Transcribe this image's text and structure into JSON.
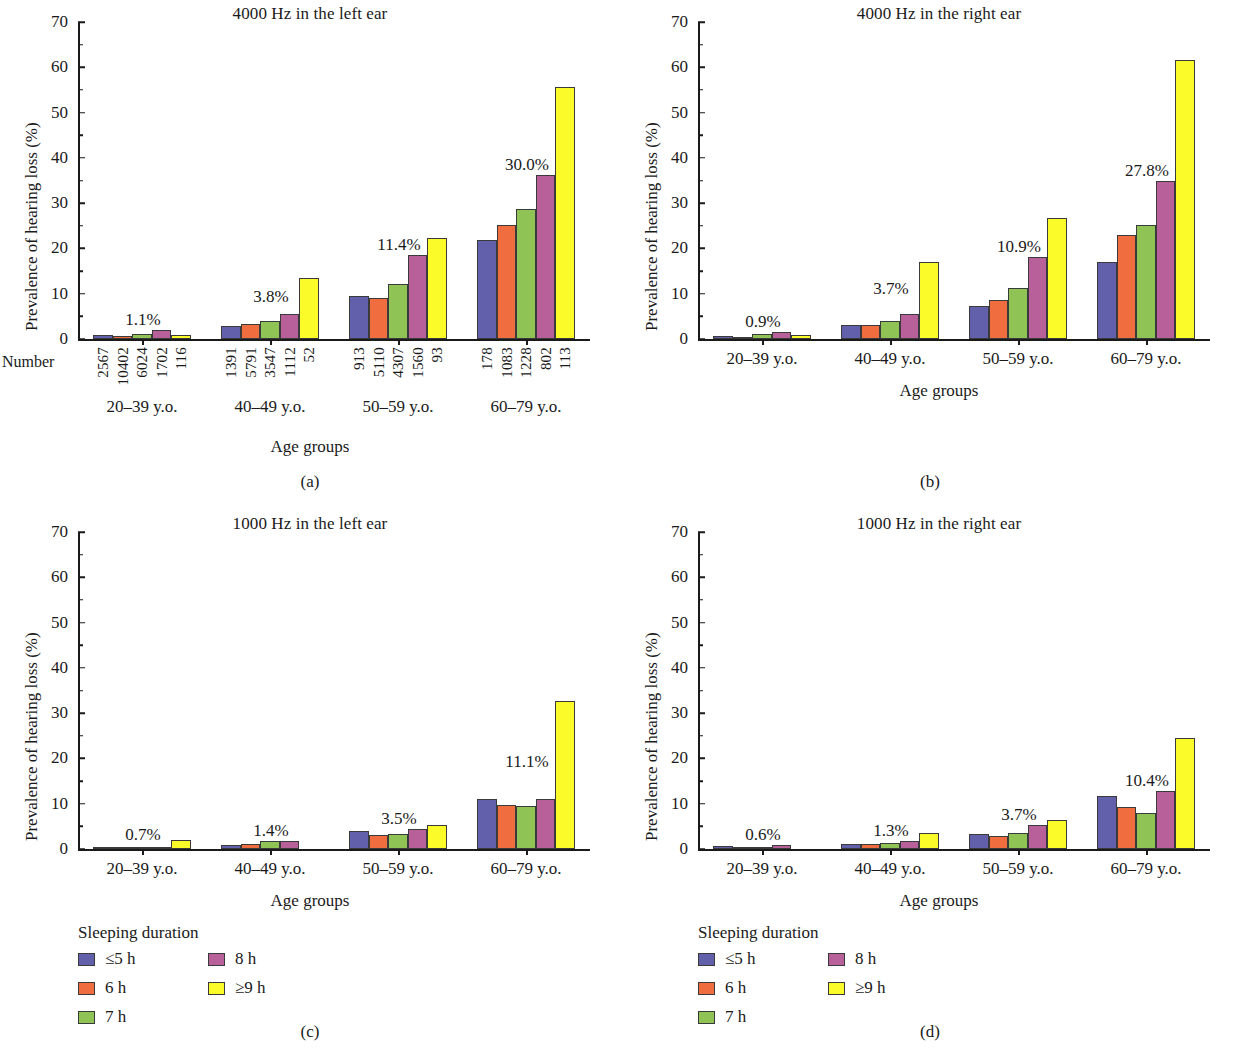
{
  "figure": {
    "axis": {
      "y_label": "Prevalence of hearing loss (%)",
      "x_label": "Age groups",
      "y_ticks": [
        "0",
        "10",
        "20",
        "30",
        "40",
        "50",
        "60",
        "70"
      ],
      "ylim": [
        0,
        70
      ]
    },
    "categories": [
      "20–39 y.o.",
      "40–49 y.o.",
      "50–59 y.o.",
      "60–79 y.o."
    ],
    "number_row_label": "Number",
    "legend": {
      "title": "Sleeping duration",
      "items": [
        {
          "label": "≤5 h",
          "color": "#6260ab"
        },
        {
          "label": "6 h",
          "color": "#ef6d3f"
        },
        {
          "label": "7 h",
          "color": "#8fc355"
        },
        {
          "label": "8 h",
          "color": "#b8609a"
        },
        {
          "label": "≥9 h",
          "color": "#fbfb2a"
        }
      ]
    },
    "series_colors": [
      "#6260ab",
      "#ef6d3f",
      "#8fc355",
      "#b8609a",
      "#fbfb2a"
    ],
    "panel_letters": [
      "(a)",
      "(b)",
      "(c)",
      "(d)"
    ]
  },
  "chart_data": [
    {
      "id": "a",
      "type": "bar",
      "title": "4000 Hz in the left ear",
      "panel_letter": "(a)",
      "xlabel": "Age groups",
      "ylabel": "Prevalence of hearing loss (%)",
      "ylim": [
        0,
        70
      ],
      "grid": false,
      "legend_position": "below-left",
      "categories": [
        "20–39 y.o.",
        "40–49 y.o.",
        "50–59 y.o.",
        "60–79 y.o."
      ],
      "series": [
        {
          "name": "≤5 h",
          "values": [
            0.8,
            2.8,
            9.4,
            21.8
          ]
        },
        {
          "name": "6 h",
          "values": [
            0.7,
            3.3,
            9.0,
            25.2
          ]
        },
        {
          "name": "7 h",
          "values": [
            1.2,
            3.9,
            12.1,
            28.7
          ]
        },
        {
          "name": "8 h",
          "values": [
            1.9,
            5.6,
            18.5,
            36.2
          ]
        },
        {
          "name": "≥9 h",
          "values": [
            0.8,
            13.5,
            22.3,
            55.6
          ]
        }
      ],
      "annotations": [
        "1.1%",
        "3.8%",
        "11.4%",
        "30.0%"
      ],
      "number_row_label": "Number",
      "numbers": [
        [
          "2567",
          "10402",
          "6024",
          "1702",
          "116"
        ],
        [
          "1391",
          "5791",
          "3547",
          "1112",
          "52"
        ],
        [
          "913",
          "5110",
          "4307",
          "1560",
          "93"
        ],
        [
          "178",
          "1083",
          "1228",
          "802",
          "113"
        ]
      ]
    },
    {
      "id": "b",
      "type": "bar",
      "title": "4000 Hz in the right ear",
      "panel_letter": "(b)",
      "xlabel": "Age groups",
      "ylabel": "Prevalence of hearing loss (%)",
      "ylim": [
        0,
        70
      ],
      "grid": false,
      "legend_position": "none",
      "categories": [
        "20–39 y.o.",
        "40–49 y.o.",
        "50–59 y.o.",
        "60–79 y.o."
      ],
      "series": [
        {
          "name": "≤5 h",
          "values": [
            0.6,
            3.1,
            7.4,
            17.1
          ]
        },
        {
          "name": "6 h",
          "values": [
            0.4,
            3.0,
            8.7,
            22.9
          ]
        },
        {
          "name": "7 h",
          "values": [
            1.2,
            4.0,
            11.3,
            25.1
          ]
        },
        {
          "name": "8 h",
          "values": [
            1.6,
            5.6,
            18.1,
            35.0
          ]
        },
        {
          "name": "≥9 h",
          "values": [
            0.9,
            17.1,
            26.7,
            61.7
          ]
        }
      ],
      "annotations": [
        "0.9%",
        "3.7%",
        "10.9%",
        "27.8%"
      ]
    },
    {
      "id": "c",
      "type": "bar",
      "title": "1000 Hz in the left ear",
      "panel_letter": "(c)",
      "xlabel": "Age groups",
      "ylabel": "Prevalence of hearing loss (%)",
      "ylim": [
        0,
        70
      ],
      "grid": false,
      "legend_position": "below-left",
      "categories": [
        "20–39 y.o.",
        "40–49 y.o.",
        "50–59 y.o.",
        "60–79 y.o."
      ],
      "series": [
        {
          "name": "≤5 h",
          "values": [
            0.5,
            0.9,
            4.0,
            11.1
          ]
        },
        {
          "name": "6 h",
          "values": [
            0.3,
            1.2,
            3.0,
            9.8
          ]
        },
        {
          "name": "7 h",
          "values": [
            0.3,
            1.8,
            3.3,
            9.5
          ]
        },
        {
          "name": "8 h",
          "values": [
            0.4,
            1.8,
            4.5,
            11.1
          ]
        },
        {
          "name": "≥9 h",
          "values": [
            1.9,
            0.0,
            5.2,
            32.6
          ]
        }
      ],
      "annotations": [
        "0.7%",
        "1.4%",
        "3.5%",
        "11.1%"
      ]
    },
    {
      "id": "d",
      "type": "bar",
      "title": "1000 Hz in the right ear",
      "panel_letter": "(d)",
      "xlabel": "Age groups",
      "ylabel": "Prevalence of hearing loss (%)",
      "ylim": [
        0,
        70
      ],
      "grid": false,
      "legend_position": "below-left",
      "categories": [
        "20–39 y.o.",
        "40–49 y.o.",
        "50–59 y.o.",
        "60–79 y.o."
      ],
      "series": [
        {
          "name": "≤5 h",
          "values": [
            0.6,
            1.2,
            3.3,
            11.6
          ]
        },
        {
          "name": "6 h",
          "values": [
            0.3,
            1.0,
            2.9,
            9.2
          ]
        },
        {
          "name": "7 h",
          "values": [
            0.1,
            1.4,
            3.5,
            8.0
          ]
        },
        {
          "name": "8 h",
          "values": [
            0.9,
            1.8,
            5.4,
            12.8
          ]
        },
        {
          "name": "≥9 h",
          "values": [
            0.0,
            3.6,
            6.4,
            24.5
          ]
        }
      ],
      "annotations": [
        "0.6%",
        "1.3%",
        "3.7%",
        "10.4%"
      ]
    }
  ]
}
